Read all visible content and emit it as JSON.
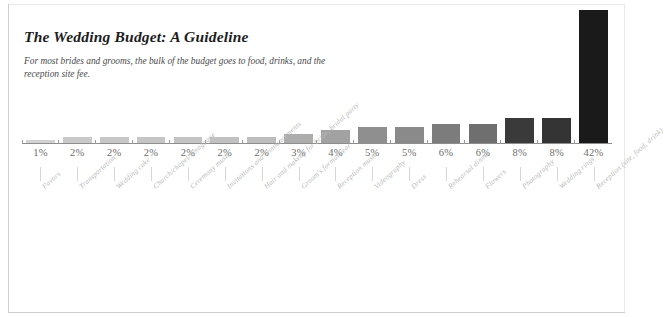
{
  "figure": {
    "title": "The Wedding Budget: A Guideline",
    "subtitle": "For most brides and grooms, the bulk of the budget goes to food, drinks, and the reception site fee."
  },
  "chart_data": {
    "type": "bar",
    "title": "The Wedding Budget: A Guideline",
    "subtitle": "For most brides and grooms, the bulk of the budget goes to food, drinks, and the reception site fee.",
    "xlabel": "",
    "ylabel": "",
    "ylim": [
      0,
      42
    ],
    "grid": false,
    "legend": null,
    "unit": "%",
    "categories": [
      "Favors",
      "Transportation",
      "Wedding cake",
      "Church/chapel/synagogue",
      "Ceremony music",
      "Invitations and announcements",
      "Hair and makeup for bride, bridal party",
      "Groom's formalwear",
      "Reception music",
      "Videography",
      "Dress",
      "Rehearsal dinner",
      "Flowers",
      "Photography",
      "Wedding rings",
      "Reception (site, food, drink)"
    ],
    "values": [
      1,
      2,
      2,
      2,
      2,
      2,
      2,
      3,
      4,
      5,
      5,
      6,
      6,
      8,
      8,
      42
    ],
    "value_labels": [
      "1%",
      "2%",
      "2%",
      "2%",
      "2%",
      "2%",
      "2%",
      "3%",
      "4%",
      "5%",
      "5%",
      "6%",
      "6%",
      "8%",
      "8%",
      "42%"
    ],
    "bar_colors": [
      "#d2d2d2",
      "#c9c9c9",
      "#c7c7c7",
      "#c5c5c5",
      "#c3c3c3",
      "#c1c1c1",
      "#bdbdbd",
      "#adadad",
      "#a2a2a2",
      "#8f8f8f",
      "#8a8a8a",
      "#7c7c7c",
      "#6f6f6f",
      "#3a3a3a",
      "#343434",
      "#1a1a1a"
    ]
  },
  "colors": {
    "background": "#ffffff",
    "axis": "#8e8e8e",
    "value_text": "#6e6e6e",
    "category_text": "#b9b9b9",
    "title_text": "#1d1d1d",
    "accent_max": "#1a1a1a"
  }
}
